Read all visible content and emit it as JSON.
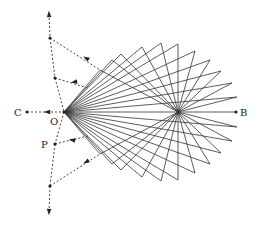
{
  "diagram": {
    "labels": {
      "C": "C",
      "O": "O",
      "P": "P",
      "B": "B"
    },
    "points": {
      "O": [
        64,
        112
      ],
      "C": [
        27,
        112
      ],
      "B": [
        236,
        112
      ],
      "center": [
        178,
        112
      ],
      "P": [
        55,
        144
      ]
    },
    "colors": {
      "line": "#333333",
      "dashed": "#333333",
      "background": "#ffffff"
    },
    "tips_upper": [
      [
        100,
        70
      ],
      [
        112,
        60
      ],
      [
        121,
        54
      ],
      [
        142,
        47
      ],
      [
        161,
        43
      ],
      [
        178,
        44
      ],
      [
        195,
        51
      ],
      [
        210,
        60
      ],
      [
        221,
        71
      ],
      [
        232,
        83
      ],
      [
        237,
        97
      ]
    ],
    "dashed_path": [
      [
        49,
        14
      ],
      [
        50,
        38
      ],
      [
        55,
        78
      ],
      [
        64,
        112
      ],
      [
        55,
        144
      ],
      [
        50,
        186
      ],
      [
        49,
        212
      ]
    ]
  }
}
